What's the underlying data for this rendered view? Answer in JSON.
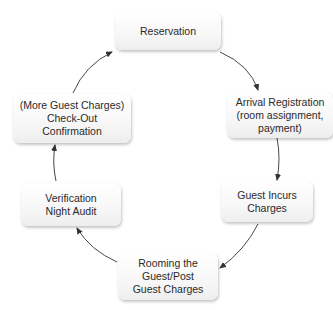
{
  "diagram": {
    "type": "cycle",
    "nodes": [
      {
        "id": "reservation",
        "lines": [
          "Reservation"
        ]
      },
      {
        "id": "arrival",
        "lines": [
          "Arrival Registration",
          "(room assignment,",
          "payment)"
        ]
      },
      {
        "id": "incurs",
        "lines": [
          "Guest Incurs",
          "Charges"
        ]
      },
      {
        "id": "rooming",
        "lines": [
          "Rooming the",
          "Guest/Post",
          "Guest Charges"
        ]
      },
      {
        "id": "audit",
        "lines": [
          "Verification",
          "Night Audit"
        ]
      },
      {
        "id": "checkout",
        "lines": [
          "(More Guest Charges)",
          "Check-Out",
          "Confirmation"
        ]
      }
    ],
    "edges": [
      {
        "from": "reservation",
        "to": "arrival"
      },
      {
        "from": "arrival",
        "to": "incurs"
      },
      {
        "from": "incurs",
        "to": "rooming"
      },
      {
        "from": "rooming",
        "to": "audit"
      },
      {
        "from": "audit",
        "to": "checkout"
      },
      {
        "from": "checkout",
        "to": "reservation"
      }
    ],
    "colors": {
      "arrow": "#333333",
      "text": "#2a2a2a",
      "box": "#f7f7f7"
    }
  }
}
